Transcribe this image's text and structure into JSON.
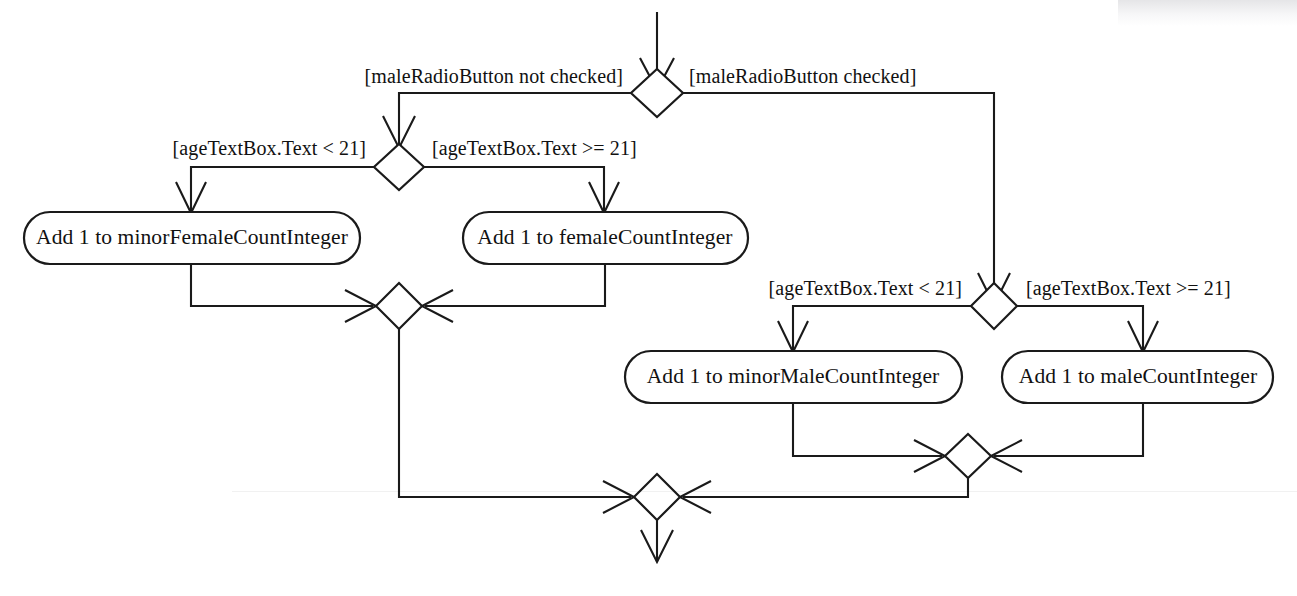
{
  "diagram": {
    "type": "uml-activity-diagram",
    "background_color": "#ffffff",
    "line_color": "#1a1a1a",
    "text_color": "#111111",
    "decisions": [
      {
        "id": "gender-decision",
        "name": "male-radio-button-decision",
        "guard_left": "[maleRadioButton not checked]",
        "guard_right": "[maleRadioButton checked]"
      },
      {
        "id": "female-age-decision",
        "name": "female-age-decision",
        "guard_left": "[ageTextBox.Text < 21]",
        "guard_right": "[ageTextBox.Text >= 21]"
      },
      {
        "id": "male-age-decision",
        "name": "male-age-decision",
        "guard_left": "[ageTextBox.Text < 21]",
        "guard_right": "[ageTextBox.Text >= 21]"
      }
    ],
    "actions": [
      {
        "id": "minor-female",
        "label": "Add 1 to minorFemaleCountInteger"
      },
      {
        "id": "female",
        "label": "Add 1 to femaleCountInteger"
      },
      {
        "id": "minor-male",
        "label": "Add 1 to minorMaleCountInteger"
      },
      {
        "id": "male",
        "label": "Add 1 to maleCountInteger"
      }
    ],
    "merges": [
      {
        "id": "female-merge",
        "name": "female-branch-merge"
      },
      {
        "id": "male-merge",
        "name": "male-branch-merge"
      },
      {
        "id": "final-merge",
        "name": "final-merge"
      }
    ]
  }
}
